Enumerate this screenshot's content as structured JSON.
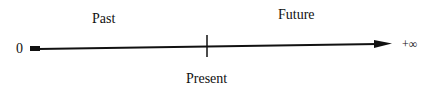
{
  "diagram": {
    "title": "",
    "labels": {
      "past": "Past",
      "future": "Future",
      "present": "Present",
      "origin": "0",
      "end": "+∞"
    },
    "colors": {
      "line": "#111111",
      "background": "#ffffff"
    }
  }
}
